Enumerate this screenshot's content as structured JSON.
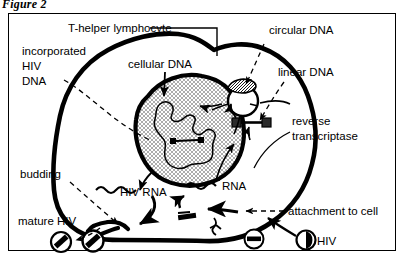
{
  "figure": {
    "caption": "Figure 2"
  },
  "diagram": {
    "type": "biological-process-diagram",
    "labels": [
      {
        "id": "t-helper-lymphocyte",
        "text": "T-helper lymphocyte",
        "leader": "solid-elbow"
      },
      {
        "id": "incorporated-hiv-dna",
        "line1": "incorporated",
        "line2": "HIV",
        "line3": "DNA",
        "leader": "dashed-curve"
      },
      {
        "id": "cellular-dna",
        "text": "cellular DNA",
        "leader": "solid-arrow"
      },
      {
        "id": "circular-dna",
        "text": "circular DNA",
        "leader": "dashed-arrow"
      },
      {
        "id": "linear-dna",
        "text": "linear DNA",
        "leader": "dashed-arrow"
      },
      {
        "id": "reverse-transcriptase",
        "line1": "reverse",
        "line2": "transcriptase",
        "leader": "solid-curve"
      },
      {
        "id": "rna",
        "text": "RNA",
        "leader": "none"
      },
      {
        "id": "hiv-rna",
        "text": "HIV RNA",
        "leader": "none"
      },
      {
        "id": "budding",
        "text": "budding",
        "leader": "dashed-arrow"
      },
      {
        "id": "mature-hiv",
        "text": "mature HIV",
        "leader": "dashed-arrow"
      },
      {
        "id": "attachment-to-cell",
        "text": "attachment to cell",
        "leader": "dashed-arrow"
      },
      {
        "id": "hiv",
        "text": "HIV",
        "leader": "solid-arrow"
      }
    ],
    "structures": [
      {
        "id": "cell-membrane",
        "shape": "thick-irregular-outline"
      },
      {
        "id": "nucleus",
        "shape": "stippled-blob",
        "fill": "crosshatch"
      },
      {
        "id": "chromatin",
        "shape": "wavy-closed-curve"
      },
      {
        "id": "circular-dna-ring",
        "shape": "circle-with-hatched-cap"
      },
      {
        "id": "linear-dna-bar",
        "shape": "bar-with-two-dark-end-squares"
      },
      {
        "id": "rna-squiggle",
        "shape": "wavy-line"
      },
      {
        "id": "hiv-rna-squiggle",
        "shape": "wavy-line"
      },
      {
        "id": "virion-mature-1",
        "shape": "circle-with-diagonal-bar"
      },
      {
        "id": "virion-mature-2",
        "shape": "circle-with-diagonal-bar"
      },
      {
        "id": "virion-empty",
        "shape": "circle-with-horizontal-bar"
      },
      {
        "id": "virion-hiv",
        "shape": "circle-with-dark-wedge"
      },
      {
        "id": "budding-site",
        "shape": "membrane-pinch"
      }
    ],
    "colors": {
      "ink": "#000000",
      "paper": "#ffffff",
      "stipple": "#dedede"
    }
  }
}
